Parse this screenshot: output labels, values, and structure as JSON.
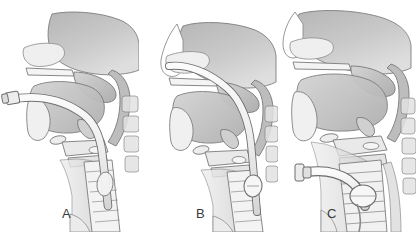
{
  "figure": {
    "background_color": "#ffffff",
    "width": 416,
    "height": 232
  },
  "palette": {
    "outline": "#6e6e6e",
    "outline_dark": "#4a4a4a",
    "tissue_light": "#e6e6e6",
    "tissue_mid": "#c4c4c4",
    "tissue_dark": "#a0a0a0",
    "tissue_darkest": "#8a8a8a",
    "device_fill": "#f2f2f2",
    "device_edge": "#7a7a7a",
    "cartilage": "#d8d8d8",
    "label_color": "#3a3a3a"
  },
  "panels": [
    {
      "id": "a",
      "label": "A",
      "label_x": 62,
      "label_y": 206,
      "description": "Orotracheal intubation - endotracheal tube passing through mouth and vocal cords into trachea with external 15mm connector at the lips",
      "device": "endotracheal-tube",
      "device_entry": "oral",
      "connector_visible": true,
      "cuff_visible": true
    },
    {
      "id": "b",
      "label": "B",
      "label_x": 196,
      "label_y": 206,
      "description": "Nasotracheal intubation - tube routed through the nasal passage and nasopharynx down into the trachea with an inflated cuff below the larynx",
      "device": "nasotracheal-tube",
      "device_entry": "nasal",
      "connector_visible": false,
      "cuff_visible": true
    },
    {
      "id": "c",
      "label": "C",
      "label_x": 327,
      "label_y": 206,
      "description": "Tracheostomy - curved cannula inserted through a surgical stoma in the anterior neck directly into the trachea, inflated cuff seated below the stoma, upper airway unobstructed",
      "device": "tracheostomy-tube",
      "device_entry": "neck-stoma",
      "connector_visible": true,
      "cuff_visible": true
    }
  ],
  "anatomy_labels": [
    "nasal-cavity",
    "hard-palate",
    "soft-palate",
    "tongue",
    "mandible",
    "oropharynx",
    "epiglottis",
    "hyoid-bone",
    "thyroid-cartilage",
    "vocal-cords",
    "cricoid-cartilage",
    "trachea",
    "tracheal-rings",
    "esophagus",
    "cervical-vertebrae",
    "spinal-cord",
    "sternum"
  ]
}
